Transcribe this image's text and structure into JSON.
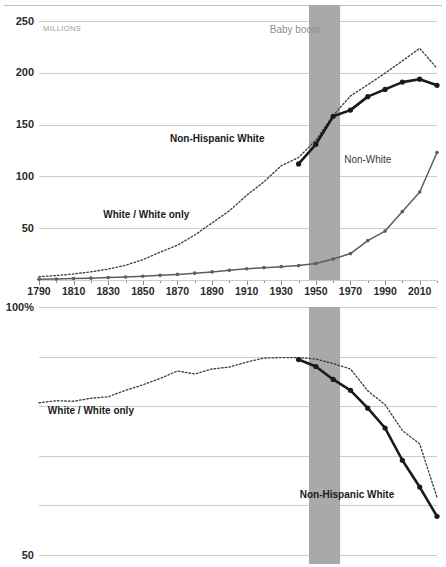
{
  "figure": {
    "units_label": "MILLIONS",
    "band_label": "Baby boom",
    "band_years": [
      1946,
      1964
    ]
  },
  "chart_data": [
    {
      "id": "population-counts",
      "type": "line",
      "title": "",
      "xlabel": "",
      "ylabel": "MILLIONS",
      "xlim": [
        1790,
        2020
      ],
      "ylim": [
        0,
        250
      ],
      "yticks": [
        50,
        100,
        150,
        200,
        250
      ],
      "ytick_labels": [
        "50",
        "100",
        "150",
        "200",
        "250"
      ],
      "xticks": [
        1790,
        1810,
        1830,
        1850,
        1870,
        1890,
        1910,
        1930,
        1950,
        1970,
        1990,
        2010
      ],
      "xtick_labels": [
        "1790",
        "1810",
        "1830",
        "1850",
        "1870",
        "1890",
        "1910",
        "1930",
        "1950",
        "1970",
        "1990",
        "2010"
      ],
      "grid": true,
      "legend_position": "inline-annotations",
      "annotations": [
        {
          "text": "Baby boom",
          "x": 1938,
          "y": 238,
          "style": "grey"
        },
        {
          "text": "Non-Hispanic White",
          "x": 1893,
          "y": 133,
          "style": "bold"
        },
        {
          "text": "Non-White",
          "x": 1980,
          "y": 113,
          "style": "regular"
        },
        {
          "text": "White / White only",
          "x": 1852,
          "y": 60,
          "style": "bold"
        }
      ],
      "series": [
        {
          "name": "White / White only",
          "style": "dotted",
          "color": "#3a3a3a",
          "markers": false,
          "x": [
            1790,
            1800,
            1810,
            1820,
            1830,
            1840,
            1850,
            1860,
            1870,
            1880,
            1890,
            1900,
            1910,
            1920,
            1930,
            1940,
            1950,
            1960,
            1970,
            1980,
            1990,
            2000,
            2010,
            2020
          ],
          "values": [
            3.2,
            4.3,
            5.9,
            7.9,
            10.5,
            14.2,
            19.6,
            26.9,
            33.6,
            43.4,
            55.1,
            66.8,
            81.7,
            94.8,
            110.3,
            118.2,
            135.1,
            158.8,
            177.7,
            188.4,
            199.7,
            211.5,
            223.6,
            204.3
          ]
        },
        {
          "name": "Non-Hispanic White",
          "style": "solid-bold",
          "color": "#1a1a1a",
          "markers": true,
          "x": [
            1940,
            1950,
            1960,
            1970,
            1980,
            1990,
            2000,
            2010,
            2020
          ],
          "values": [
            112.0,
            131.0,
            158.0,
            164.0,
            177.0,
            184.0,
            191.0,
            193.8,
            187.9
          ]
        },
        {
          "name": "Non-White",
          "style": "solid-grey",
          "color": "#5d5d5d",
          "markers": true,
          "x": [
            1790,
            1800,
            1810,
            1820,
            1830,
            1840,
            1850,
            1860,
            1870,
            1880,
            1890,
            1900,
            1910,
            1920,
            1930,
            1940,
            1950,
            1960,
            1970,
            1980,
            1990,
            2000,
            2010,
            2020
          ],
          "values": [
            0.8,
            1.0,
            1.4,
            1.8,
            2.3,
            2.9,
            3.6,
            4.5,
            5.4,
            6.6,
            7.8,
            9.3,
            10.8,
            11.9,
            12.9,
            13.9,
            15.9,
            20.3,
            25.5,
            38.0,
            47.2,
            66.0,
            85.0,
            123.0
          ]
        }
      ]
    },
    {
      "id": "population-share",
      "type": "line",
      "title": "",
      "xlabel": "",
      "ylabel": "percent",
      "xlim": [
        1790,
        2020
      ],
      "ylim": [
        50,
        100
      ],
      "yticks": [
        50,
        60,
        70,
        80,
        90,
        100
      ],
      "ytick_labels": [
        "50",
        "",
        "",
        "",
        "",
        "100%"
      ],
      "xticks": [
        1790,
        1810,
        1830,
        1850,
        1870,
        1890,
        1910,
        1930,
        1950,
        1970,
        1990,
        2010
      ],
      "xtick_labels": [
        "1790",
        "1810",
        "1830",
        "1850",
        "1870",
        "1890",
        "1910",
        "1930",
        "1950",
        "1970",
        "1990",
        "2010"
      ],
      "grid": true,
      "legend_position": "inline-annotations",
      "annotations": [
        {
          "text": "White / White only",
          "x": 1820,
          "y": 78.5,
          "style": "bold"
        },
        {
          "text": "Non-Hispanic White",
          "x": 1968,
          "y": 61.5,
          "style": "bold"
        }
      ],
      "series": [
        {
          "name": "White / White only",
          "style": "dotted",
          "color": "#3a3a3a",
          "markers": false,
          "x": [
            1790,
            1800,
            1810,
            1820,
            1830,
            1840,
            1850,
            1860,
            1870,
            1880,
            1890,
            1900,
            1910,
            1920,
            1930,
            1940,
            1950,
            1960,
            1970,
            1980,
            1990,
            2000,
            2010,
            2020
          ],
          "values": [
            80.7,
            81.1,
            81.0,
            81.6,
            81.9,
            83.2,
            84.3,
            85.6,
            87.1,
            86.5,
            87.5,
            87.9,
            88.9,
            89.7,
            89.8,
            89.8,
            89.5,
            88.6,
            87.5,
            83.1,
            80.3,
            75.1,
            72.4,
            61.6
          ]
        },
        {
          "name": "Non-Hispanic White",
          "style": "solid-bold",
          "color": "#1a1a1a",
          "markers": true,
          "x": [
            1940,
            1950,
            1960,
            1970,
            1980,
            1990,
            2000,
            2010,
            2020
          ],
          "values": [
            89.4,
            88.0,
            85.4,
            83.2,
            79.6,
            75.6,
            69.1,
            63.7,
            57.8
          ]
        }
      ]
    }
  ]
}
